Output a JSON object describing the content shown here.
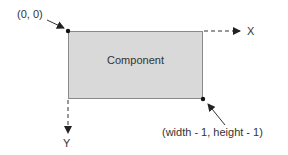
{
  "diagram": {
    "component": {
      "label": "Component",
      "fill": "#d9d9d9",
      "border": "#8a8a8a"
    },
    "origin_label": "(0, 0)",
    "corner_label": "(width - 1, height - 1)",
    "x_axis_label": "X",
    "y_axis_label": "Y",
    "line_color": "#333333"
  }
}
